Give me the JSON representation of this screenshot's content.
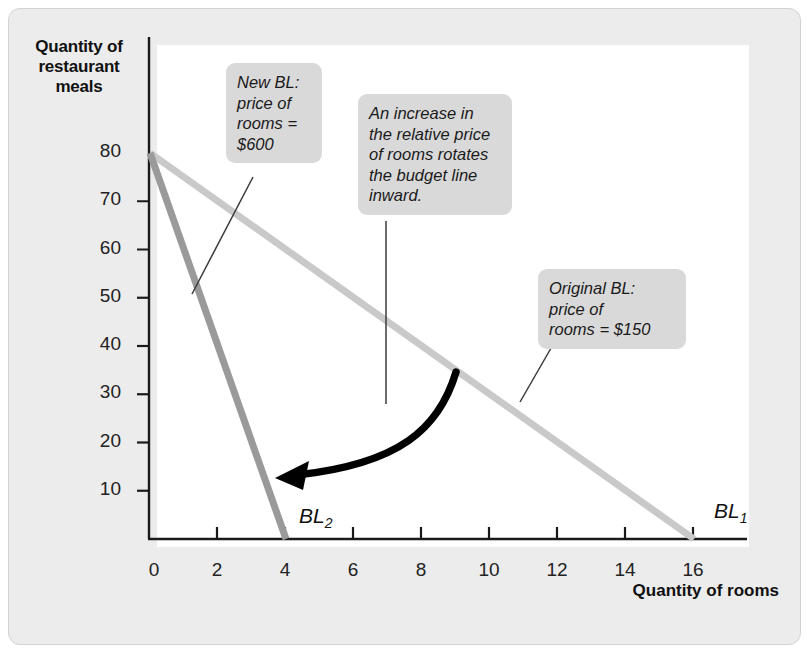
{
  "figure": {
    "background": "#ececec",
    "plot_background": "#ffffff",
    "frame_border": "#d2d2d2"
  },
  "axes": {
    "y_title": "Quantity of restaurant meals",
    "y_title_lines": [
      "Quantity of",
      "restaurant",
      "meals"
    ],
    "x_title": "Quantity of rooms",
    "origin_label": "0",
    "y_ticks": [
      10,
      20,
      30,
      40,
      50,
      60,
      70,
      80
    ],
    "x_ticks": [
      2,
      4,
      6,
      8,
      10,
      12,
      14,
      16
    ],
    "axis_color": "#1a1a1a"
  },
  "callouts": {
    "new_bl": {
      "lines": [
        "New BL:",
        "price of",
        "rooms =",
        "$600"
      ],
      "text": "New BL: price of rooms = $600"
    },
    "rotate": {
      "lines": [
        "An increase in",
        "the relative price",
        "of rooms rotates",
        "the budget line",
        "inward."
      ],
      "text": "An increase in the relative price of rooms rotates the budget line inward."
    },
    "original_bl": {
      "lines": [
        "Original BL:",
        "price of",
        "rooms = $150"
      ],
      "text": "Original BL: price of rooms = $150"
    }
  },
  "series_labels": {
    "bl1": {
      "base": "BL",
      "sub": "1"
    },
    "bl2": {
      "base": "BL",
      "sub": "2"
    }
  },
  "colors": {
    "bl1_line": "#c9c9c9",
    "bl2_line": "#9a9a9a",
    "arrow": "#000000",
    "callout_bg": "#d9d9d9",
    "leader_line": "#3a3a3a"
  },
  "chart_data": {
    "type": "line",
    "title": "",
    "xlabel": "Quantity of rooms",
    "ylabel": "Quantity of restaurant meals",
    "xlim": [
      0,
      17.4
    ],
    "ylim": [
      0,
      84
    ],
    "grid": false,
    "legend": "inline-labels",
    "series": [
      {
        "name": "BL1",
        "label": "Original BL: price of rooms = $150",
        "color": "#c9c9c9",
        "price_of_rooms": 150,
        "x": [
          0,
          16
        ],
        "y": [
          80,
          0
        ]
      },
      {
        "name": "BL2",
        "label": "New BL: price of rooms = $600",
        "color": "#9a9a9a",
        "price_of_rooms": 600,
        "x": [
          0,
          4
        ],
        "y": [
          80,
          0
        ]
      }
    ],
    "annotations": [
      {
        "name": "new-bl",
        "text": "New BL: price of rooms = $600",
        "points_to": [
          1.25,
          53
        ]
      },
      {
        "name": "rotate",
        "text": "An increase in the relative price of rooms rotates the budget line inward.",
        "points_to": [
          6.7,
          33
        ]
      },
      {
        "name": "original-bl",
        "text": "Original BL: price of rooms = $150",
        "points_to": [
          10.6,
          27
        ]
      },
      {
        "name": "rotation-arrow",
        "text": "",
        "from": [
          8.7,
          32
        ],
        "to": [
          3.9,
          12
        ]
      }
    ]
  }
}
